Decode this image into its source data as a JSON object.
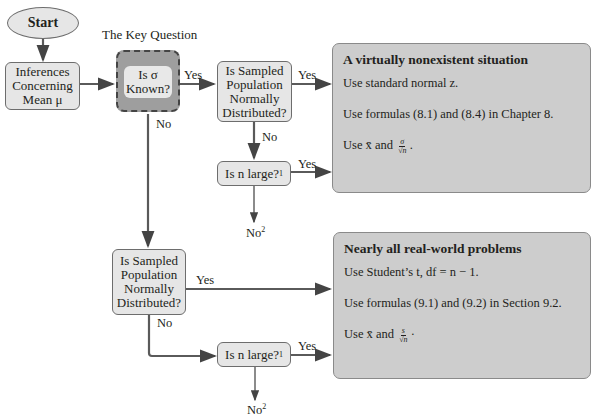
{
  "title": "The Key Question",
  "nodes": {
    "start": "Start",
    "inferences": [
      "Inferences",
      "Concerning",
      "Mean μ"
    ],
    "sigma_known": [
      "Is σ",
      "Known?"
    ],
    "normal_top": [
      "Is Sampled",
      "Population",
      "Normally",
      "Distributed?"
    ],
    "n_large_top": "Is n large?",
    "n_large_top_sup": "1",
    "normal_bottom": [
      "Is Sampled",
      "Population",
      "Normally",
      "Distributed?"
    ],
    "n_large_bottom": "Is n large?",
    "n_large_bottom_sup": "1"
  },
  "edge_labels": {
    "sigma_yes": "Yes",
    "sigma_no": "No",
    "normal_top_yes": "Yes",
    "normal_top_no": "No",
    "n_large_top_yes": "Yes",
    "n_large_top_no": "No",
    "n_large_top_no_sup": "2",
    "normal_bottom_yes": "Yes",
    "normal_bottom_no": "No",
    "n_large_bottom_yes": "Yes",
    "n_large_bottom_no": "No",
    "n_large_bottom_no_sup": "2"
  },
  "results": {
    "top": {
      "heading": "A virtually nonexistent situation",
      "line1": "Use standard normal z.",
      "line2": "Use formulas (8.1) and (8.4) in Chapter 8.",
      "line3_prefix": "Use x̄ and",
      "line3_num": "σ",
      "line3_den": "√n",
      "line3_suffix": "."
    },
    "bottom": {
      "heading": "Nearly all real-world problems",
      "line1": "Use Student’s t, df = n − 1.",
      "line2": "Use formulas (9.1) and (9.2) in Section 9.2.",
      "line3_prefix": "Use x̄ and",
      "line3_num": "s",
      "line3_den": "√n",
      "line3_suffix": "·"
    }
  },
  "colors": {
    "node_fill": "#e6e6e6",
    "key_outer": "#9e9e9e",
    "result_fill": "#cdcdcd",
    "line": "#5a5a5a"
  }
}
